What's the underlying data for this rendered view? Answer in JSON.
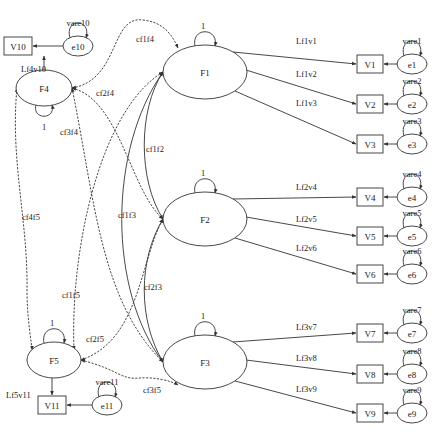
{
  "diagram": {
    "type": "structural-equation-model path diagram",
    "latent_factors": [
      {
        "id": "F1",
        "label": "F1",
        "variance_label": "1"
      },
      {
        "id": "F2",
        "label": "F2",
        "variance_label": "1"
      },
      {
        "id": "F3",
        "label": "F3",
        "variance_label": "1"
      },
      {
        "id": "F4",
        "label": "F4",
        "variance_label": "1"
      },
      {
        "id": "F5",
        "label": "F5",
        "variance_label": "1"
      }
    ],
    "observed": [
      {
        "id": "V1",
        "label": "V1",
        "factor": "F1",
        "loading": "Lf1v1",
        "error": "e1",
        "error_var": "vare1"
      },
      {
        "id": "V2",
        "label": "V2",
        "factor": "F1",
        "loading": "Lf1v2",
        "error": "e2",
        "error_var": "vare2"
      },
      {
        "id": "V3",
        "label": "V3",
        "factor": "F1",
        "loading": "Lf1v3",
        "error": "e3",
        "error_var": "vare3"
      },
      {
        "id": "V4",
        "label": "V4",
        "factor": "F2",
        "loading": "Lf2v4",
        "error": "e4",
        "error_var": "vare4"
      },
      {
        "id": "V5",
        "label": "V5",
        "factor": "F2",
        "loading": "Lf2v5",
        "error": "e5",
        "error_var": "vare5"
      },
      {
        "id": "V6",
        "label": "V6",
        "factor": "F2",
        "loading": "Lf2v6",
        "error": "e6",
        "error_var": "vare6"
      },
      {
        "id": "V7",
        "label": "V7",
        "factor": "F3",
        "loading": "Lf3v7",
        "error": "e7",
        "error_var": "vare7"
      },
      {
        "id": "V8",
        "label": "V8",
        "factor": "F3",
        "loading": "Lf3v8",
        "error": "e8",
        "error_var": "vare8"
      },
      {
        "id": "V9",
        "label": "V9",
        "factor": "F3",
        "loading": "Lf3v9",
        "error": "e9",
        "error_var": "vare9"
      },
      {
        "id": "V10",
        "label": "V10",
        "factor": "F4",
        "loading": "Lf4v10",
        "error": "e10",
        "error_var": "vare10"
      },
      {
        "id": "V11",
        "label": "V11",
        "factor": "F5",
        "loading": "Lf5v11",
        "error": "e11",
        "error_var": "vare11"
      }
    ],
    "covariances": [
      {
        "from": "F1",
        "to": "F2",
        "label": "cf1f2",
        "style": "solid"
      },
      {
        "from": "F1",
        "to": "F3",
        "label": "cf1f3",
        "style": "solid"
      },
      {
        "from": "F2",
        "to": "F3",
        "label": "cf2f3",
        "style": "solid"
      },
      {
        "from": "F1",
        "to": "F4",
        "label": "cf1f4",
        "style": "dashed"
      },
      {
        "from": "F2",
        "to": "F4",
        "label": "cf2f4",
        "style": "dashed"
      },
      {
        "from": "F3",
        "to": "F4",
        "label": "cf3f4",
        "style": "dashed"
      },
      {
        "from": "F4",
        "to": "F5",
        "label": "cf4f5",
        "style": "dashed"
      },
      {
        "from": "F1",
        "to": "F5",
        "label": "cf1f5",
        "style": "dashed"
      },
      {
        "from": "F2",
        "to": "F5",
        "label": "cf2f5",
        "style": "dashed"
      },
      {
        "from": "F3",
        "to": "F5",
        "label": "cf3f5",
        "style": "dashed"
      }
    ]
  }
}
